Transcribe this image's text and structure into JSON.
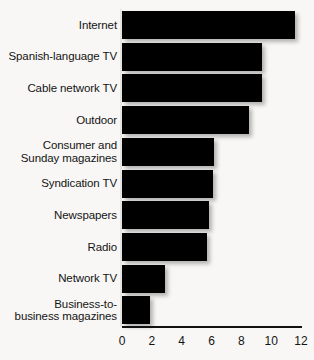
{
  "chart_data": {
    "type": "bar",
    "orientation": "horizontal",
    "title": "",
    "subtitle": "",
    "xlabel": "",
    "ylabel": "",
    "xlim": [
      0,
      12
    ],
    "xticks": [
      0,
      2,
      4,
      6,
      8,
      10,
      12
    ],
    "xtick_labels": [
      "0",
      "2",
      "4",
      "6",
      "8",
      "10",
      "12"
    ],
    "grid": false,
    "legend": null,
    "bar_color": "#000000",
    "background_color": "#f8f7f5",
    "axis_color": "#111111",
    "categories": [
      "Internet",
      "Spanish-language TV",
      "Cable network TV",
      "Outdoor",
      "Consumer and\nSunday magazines",
      "Syndication TV",
      "Newspapers",
      "Radio",
      "Network TV",
      "Business-to-\nbusiness magazines"
    ],
    "values": [
      11.6,
      9.4,
      9.4,
      8.5,
      6.2,
      6.1,
      5.8,
      5.7,
      2.9,
      1.9
    ]
  }
}
